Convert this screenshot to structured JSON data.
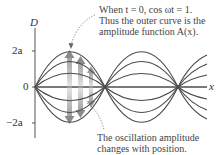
{
  "axes": {
    "y_label": "D",
    "x_label": "x",
    "ticks": [
      {
        "label": "2a",
        "value": "2a"
      },
      {
        "label": "0",
        "value": "0"
      },
      {
        "label": "−2a",
        "value": "-2a"
      }
    ]
  },
  "annotations": {
    "top": {
      "line1": "When t = 0, cos ωt = 1.",
      "line2": "Thus the outer curve is the",
      "line3": "amplitude function A(x)."
    },
    "bottom": {
      "line1": "The oscillation amplitude",
      "line2": "changes with position."
    }
  },
  "colors": {
    "curve": "#4a4a4a",
    "axis": "#555555",
    "arrow": "#bdbdbd",
    "text": "#444444"
  }
}
